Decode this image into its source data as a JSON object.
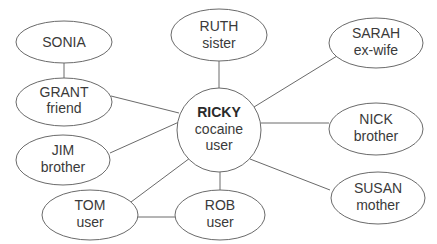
{
  "diagram": {
    "type": "relationship-network",
    "center": {
      "id": "ricky",
      "name": "RICKY",
      "lines": [
        "cocaine",
        "user"
      ]
    },
    "nodes": [
      {
        "id": "sonia",
        "name": "SONIA",
        "role": ""
      },
      {
        "id": "grant",
        "name": "GRANT",
        "role": "friend"
      },
      {
        "id": "ruth",
        "name": "RUTH",
        "role": "sister"
      },
      {
        "id": "sarah",
        "name": "SARAH",
        "role": "ex-wife"
      },
      {
        "id": "nick",
        "name": "NICK",
        "role": "brother"
      },
      {
        "id": "jim",
        "name": "JIM",
        "role": "brother"
      },
      {
        "id": "susan",
        "name": "SUSAN",
        "role": "mother"
      },
      {
        "id": "tom",
        "name": "TOM",
        "role": "user"
      },
      {
        "id": "rob",
        "name": "ROB",
        "role": "user"
      }
    ],
    "edges": [
      [
        "sonia",
        "grant"
      ],
      [
        "grant",
        "ricky"
      ],
      [
        "ruth",
        "ricky"
      ],
      [
        "sarah",
        "ricky"
      ],
      [
        "nick",
        "ricky"
      ],
      [
        "jim",
        "ricky"
      ],
      [
        "susan",
        "ricky"
      ],
      [
        "tom",
        "ricky"
      ],
      [
        "rob",
        "ricky"
      ],
      [
        "tom",
        "rob"
      ]
    ],
    "colors": {
      "stroke": "#6a6a6a",
      "text": "#3a3a3a",
      "background": "#ffffff"
    }
  }
}
